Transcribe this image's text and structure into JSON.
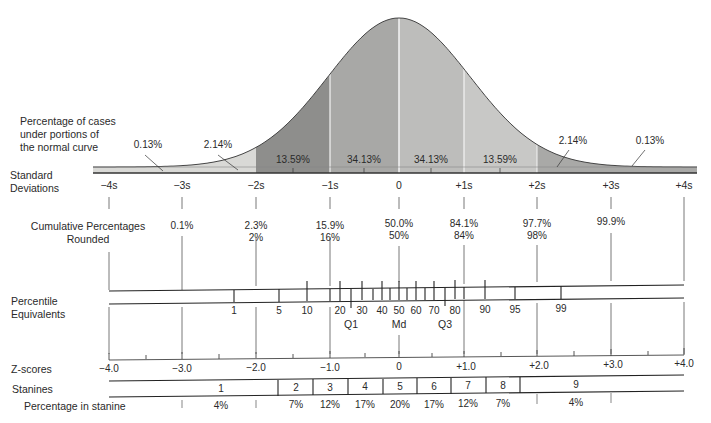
{
  "labels": {
    "cases_line1": "Percentage of cases",
    "cases_line2": "under portions of",
    "cases_line3": "the normal curve",
    "sd_line1": "Standard",
    "sd_line2": "Deviations",
    "cum_line1": "Cumulative Percentages",
    "cum_line2": "Rounded",
    "pct_line1": "Percentile",
    "pct_line2": "Equivalents",
    "zscores": "Z-scores",
    "stanines": "Stanines",
    "pct_in_stanine": "Percentage in stanine"
  },
  "chart_data": {
    "type": "area",
    "title": "Percentage of cases under portions of the normal curve",
    "regions": [
      {
        "range": "-4s to -3s",
        "percent": "0.13%"
      },
      {
        "range": "-3s to -2s",
        "percent": "2.14%"
      },
      {
        "range": "-2s to -1s",
        "percent": "13.59%"
      },
      {
        "range": "-1s to 0",
        "percent": "34.13%"
      },
      {
        "range": "0 to +1s",
        "percent": "34.13%"
      },
      {
        "range": "+1s to +2s",
        "percent": "13.59%"
      },
      {
        "range": "+2s to +3s",
        "percent": "2.14%"
      },
      {
        "range": "+3s to +4s",
        "percent": "0.13%"
      }
    ],
    "standard_deviations": [
      "−4s",
      "−3s",
      "−2s",
      "−1s",
      "0",
      "+1s",
      "+2s",
      "+3s",
      "+4s"
    ],
    "cumulative_percentages": [
      {
        "sd": "−3s",
        "exact": "0.1%",
        "rounded": ""
      },
      {
        "sd": "−2s",
        "exact": "2.3%",
        "rounded": "2%"
      },
      {
        "sd": "−1s",
        "exact": "15.9%",
        "rounded": "16%"
      },
      {
        "sd": "0",
        "exact": "50.0%",
        "rounded": "50%"
      },
      {
        "sd": "+1s",
        "exact": "84.1%",
        "rounded": "84%"
      },
      {
        "sd": "+2s",
        "exact": "97.7%",
        "rounded": "98%"
      },
      {
        "sd": "+3s",
        "exact": "99.9%",
        "rounded": ""
      }
    ],
    "percentile_equivalents": [
      "1",
      "5",
      "10",
      "20",
      "30",
      "40",
      "50",
      "60",
      "70",
      "80",
      "90",
      "95",
      "99"
    ],
    "quartiles": [
      "Q1",
      "Md",
      "Q3"
    ],
    "z_scores": [
      "−4.0",
      "−3.0",
      "−2.0",
      "−1.0",
      "0",
      "+1.0",
      "+2.0",
      "+3.0",
      "+4.0"
    ],
    "stanines": [
      "1",
      "2",
      "3",
      "4",
      "5",
      "6",
      "7",
      "8",
      "9"
    ],
    "stanine_percentages": [
      "4%",
      "7%",
      "12%",
      "17%",
      "20%",
      "17%",
      "12%",
      "7%",
      "4%"
    ],
    "xlim": [
      -4,
      4
    ]
  }
}
